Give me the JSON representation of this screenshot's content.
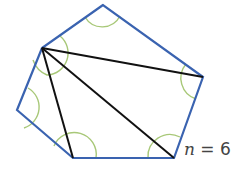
{
  "diagram": {
    "vertices": [
      [
        103,
        5
      ],
      [
        42,
        48
      ],
      [
        17,
        110
      ],
      [
        73,
        158
      ],
      [
        174,
        158
      ],
      [
        203,
        77
      ]
    ],
    "diagonals_from_vertex": 1,
    "colors": {
      "polygon": "#3a63b0",
      "diagonal": "#111111",
      "angle_arc": "#a8c878"
    },
    "label": {
      "variable": "n",
      "equals": "=",
      "value": "6"
    }
  }
}
